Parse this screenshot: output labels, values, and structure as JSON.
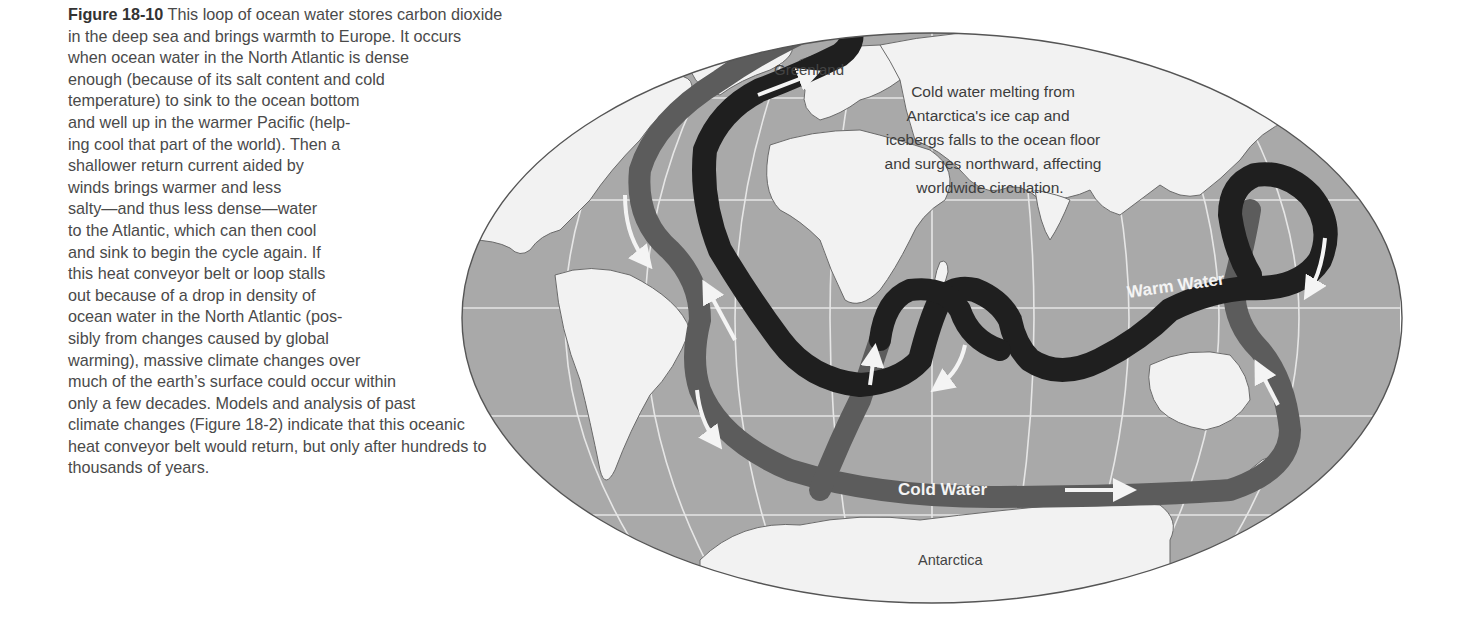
{
  "caption": {
    "figure_label": "Figure 18-10",
    "lines": [
      " This loop of ocean water stores carbon dioxide",
      "in the deep sea and brings warmth to Europe. It occurs",
      "when ocean water in the North Atlantic is dense",
      "enough (because of its salt content and cold",
      "temperature) to sink to the ocean bottom",
      "and well up in the warmer Pacific (help-",
      "ing cool that part of the world). Then a",
      "shallower return current aided by",
      "winds brings warmer and less",
      "salty—and thus less dense—water",
      "to the Atlantic, which can then cool",
      "and sink to begin the cycle again. If",
      "this heat conveyor belt or loop stalls",
      "out because of a drop in density of",
      "ocean water in the North Atlantic (pos-",
      "sibly from changes caused by global",
      "warming), massive climate changes over",
      "much of the earth’s surface could occur within",
      "only a few decades. Models and analysis of past",
      "climate changes (Figure 18-2) indicate that this oceanic",
      "heat conveyor belt would return, but only after hundreds to",
      "thousands of years."
    ]
  },
  "map": {
    "labels": {
      "greenland": "Greenland",
      "antarctica": "Antarctica",
      "warm_water": "Warm Water",
      "cold_water": "Cold Water",
      "annotation": [
        "Cold water melting from",
        "Antarctica's ice cap and",
        "icebergs falls to the ocean floor",
        "and surges northward, affecting",
        "worldwide circulation."
      ]
    },
    "colors": {
      "ocean": "#a9a9a9",
      "land": "#f2f2f2",
      "grid": "#e6e6e6",
      "warm_current": "#1f1f1f",
      "cold_current": "#5c5c5c",
      "arrow": "#f4f4f4",
      "outline": "#555555"
    }
  }
}
